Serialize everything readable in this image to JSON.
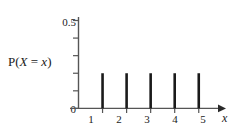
{
  "chart_data": {
    "type": "bar",
    "title": "",
    "subtitle": "",
    "xlabel": "x",
    "ylabel": "P(X = x)",
    "categories": [
      "1",
      "2",
      "3",
      "4",
      "5"
    ],
    "x": [
      1,
      2,
      3,
      4,
      5
    ],
    "values": [
      0.2,
      0.2,
      0.2,
      0.2,
      0.2
    ],
    "series": [
      {
        "name": "P(X = x)",
        "values": [
          0.2,
          0.2,
          0.2,
          0.2,
          0.2
        ]
      }
    ],
    "xlim": [
      0,
      5.8
    ],
    "ylim": [
      0,
      0.55
    ],
    "y_ticks": [
      0,
      0.1,
      0.2,
      0.3,
      0.4,
      0.5
    ],
    "y_tick_labels": [
      "0",
      "",
      "",
      "",
      "",
      "0.5"
    ],
    "x_ticks": [
      1,
      2,
      3,
      4,
      5
    ],
    "x_tick_labels": [
      "1",
      "2",
      "3",
      "4",
      "5"
    ],
    "grid": false,
    "legend": false,
    "legend_position": "none",
    "annotations": [],
    "x_axis_arrow": true,
    "bar_color": "#1a1a1a",
    "axis_color": "#555555",
    "background_color": "#ffffff"
  },
  "labels": {
    "y_axis_label_prefix": "P(",
    "y_axis_label_var": "X",
    "y_axis_label_eq": " = ",
    "y_axis_label_val": "x",
    "y_axis_label_suffix": ")",
    "x_axis_label": "x",
    "y_top_tick": "0.5",
    "y_zero_tick": "0",
    "x_tick_1": "1",
    "x_tick_2": "2",
    "x_tick_3": "3",
    "x_tick_4": "4",
    "x_tick_5": "5"
  }
}
